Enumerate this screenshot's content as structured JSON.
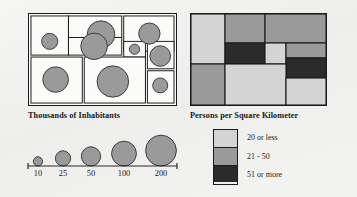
{
  "figure": {
    "background_color": "#f2f2f0"
  },
  "panels": {
    "proportional": {
      "title": "Thousands of Inhabitants",
      "frame_color": "#1b1b1b",
      "fill_color": "#fbfbfa"
    },
    "choropleth": {
      "title": "Persons per Square Kilometer",
      "frame_color": "#1b1b1b"
    }
  },
  "legend": {
    "items": [
      {
        "label": "20 or less",
        "color": "#d4d4d4"
      },
      {
        "label": "21 - 50",
        "color": "#9a9a9a"
      },
      {
        "label": "51 or more",
        "color": "#2b2b2b"
      }
    ]
  },
  "size_scale": {
    "labels": [
      "10",
      "25",
      "50",
      "100",
      "200"
    ],
    "axis_color": "#2a2a2a",
    "symbol_color": "#9a9a9a",
    "symbol_stroke": "#3c3c3c"
  },
  "chart_data": {
    "type": "map",
    "subtitle": "",
    "xlabel": "",
    "ylabel": "",
    "grid": false,
    "legend_position": "bottom-right",
    "panels": [
      {
        "name": "proportional-symbol-map",
        "title": "Thousands of Inhabitants",
        "map_type": "proportional_symbol",
        "units": "thousands of inhabitants",
        "symbol_color": "#9a9a9a",
        "symbol_stroke": "#3c3c3c",
        "regions": [
          {
            "id": "r1",
            "cell": [
              2,
              2,
              38,
              40
            ],
            "cx": 21,
            "cy": 28,
            "r": 8.2,
            "value": 25
          },
          {
            "id": "r2",
            "cell": [
              40,
              2,
              54,
              22
            ],
            "cx": 73,
            "cy": 21,
            "r": 14.0,
            "value": 100
          },
          {
            "id": "r3",
            "cell": [
              40,
              24,
              54,
              18
            ],
            "cx": 66,
            "cy": 33,
            "r": 13.5,
            "value": 100
          },
          {
            "id": "r4",
            "cell": [
              96,
              2,
              51,
              36
            ],
            "cx": 122,
            "cy": 20,
            "r": 10.8,
            "value": 50
          },
          {
            "id": "r5",
            "cell": [
              96,
              28,
              22,
              16
            ],
            "cx": 107,
            "cy": 36,
            "r": 5.2,
            "value": 10
          },
          {
            "id": "r6",
            "cell": [
              2,
              44,
              52,
              47
            ],
            "cx": 27,
            "cy": 67,
            "r": 13.0,
            "value": 100
          },
          {
            "id": "r7",
            "cell": [
              56,
              44,
              62,
              47
            ],
            "cx": 85,
            "cy": 69,
            "r": 16.0,
            "value": 200
          },
          {
            "id": "r8",
            "cell": [
              120,
              28,
              27,
              28
            ],
            "cx": 133,
            "cy": 43,
            "r": 10.5,
            "value": 50
          },
          {
            "id": "r9",
            "cell": [
              120,
              58,
              27,
              33
            ],
            "cx": 133,
            "cy": 73,
            "r": 7.6,
            "value": 25
          }
        ]
      },
      {
        "name": "choropleth-map",
        "title": "Persons per Square Kilometer",
        "map_type": "choropleth",
        "units": "persons per square kilometer",
        "classes": [
          {
            "label": "20 or less",
            "color": "#d4d4d4",
            "range": [
              0,
              20
            ]
          },
          {
            "label": "21 - 50",
            "color": "#9a9a9a",
            "range": [
              21,
              50
            ]
          },
          {
            "label": "51 or more",
            "color": "#2b2b2b",
            "range": [
              51,
              null
            ]
          }
        ],
        "regions": [
          {
            "id": "c1",
            "rect": [
              0,
              0,
              34,
              50
            ],
            "class": "20 or less"
          },
          {
            "id": "c2",
            "rect": [
              34,
              0,
              40,
              29
            ],
            "class": "21 - 50"
          },
          {
            "id": "c3",
            "rect": [
              74,
              0,
              61,
              29
            ],
            "class": "21 - 50"
          },
          {
            "id": "c4",
            "rect": [
              34,
              29,
              40,
              21
            ],
            "class": "51 or more"
          },
          {
            "id": "c5",
            "rect": [
              74,
              29,
              21,
              21
            ],
            "class": "20 or less"
          },
          {
            "id": "c6",
            "rect": [
              95,
              29,
              40,
              15
            ],
            "class": "21 - 50"
          },
          {
            "id": "c7",
            "rect": [
              95,
              44,
              40,
              20
            ],
            "class": "51 or more"
          },
          {
            "id": "c8",
            "rect": [
              0,
              50,
              34,
              41
            ],
            "class": "21 - 50"
          },
          {
            "id": "c9",
            "rect": [
              34,
              50,
              61,
              41
            ],
            "class": "20 or less"
          },
          {
            "id": "c10",
            "rect": [
              95,
              64,
              40,
              27
            ],
            "class": "20 or less"
          }
        ]
      }
    ],
    "size_legend": {
      "categories": [
        "10",
        "25",
        "50",
        "100",
        "200"
      ],
      "values": [
        10,
        25,
        50,
        100,
        200
      ],
      "radii": [
        4.6,
        7.6,
        9.6,
        12.4,
        15.4
      ],
      "units": "thousands of inhabitants"
    }
  }
}
